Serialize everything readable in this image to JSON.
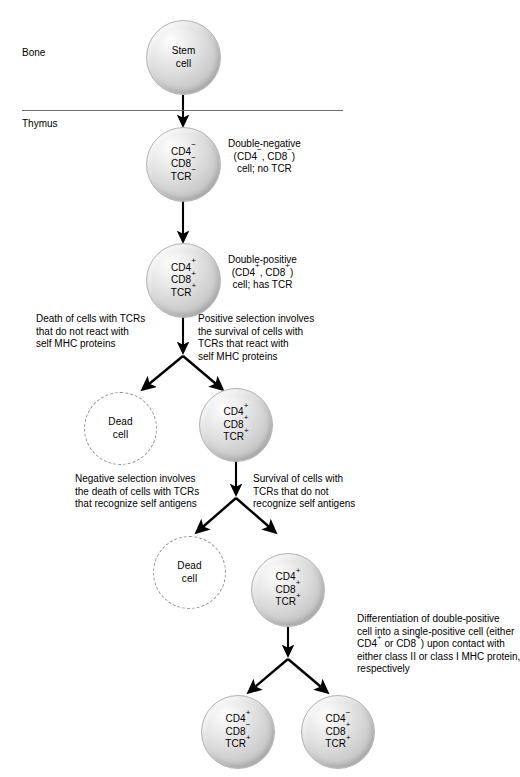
{
  "diagram": {
    "regions": [
      {
        "id": "bone-marrow",
        "label": "Bone\nmarrow"
      },
      {
        "id": "thymus",
        "label": "Thymus"
      }
    ],
    "divider": {
      "name": "bone-marrow-thymus-divider",
      "color": "#6f6f6f"
    },
    "cells": [
      {
        "id": "stem-cell",
        "lines": [
          "Stem",
          "cell"
        ],
        "type": "live"
      },
      {
        "id": "double-negative-cell",
        "lines": [
          "CD4−",
          "CD8−",
          "TCR−"
        ],
        "type": "live"
      },
      {
        "id": "double-positive-cell",
        "lines": [
          "CD4+",
          "CD8+",
          "TCR+"
        ],
        "type": "live"
      },
      {
        "id": "dead-cell-positive-selection",
        "lines": [
          "Dead",
          "cell"
        ],
        "type": "dead"
      },
      {
        "id": "positively-selected-cell",
        "lines": [
          "CD4+",
          "CD8+",
          "TCR+"
        ],
        "type": "live"
      },
      {
        "id": "dead-cell-negative-selection",
        "lines": [
          "Dead",
          "cell"
        ],
        "type": "dead"
      },
      {
        "id": "negatively-selected-survivor",
        "lines": [
          "CD4+",
          "CD8+",
          "TCR+"
        ],
        "type": "live"
      },
      {
        "id": "single-positive-cd4-cell",
        "lines": [
          "CD4+",
          "CD8−",
          "TCR+"
        ],
        "type": "live"
      },
      {
        "id": "single-positive-cd8-cell",
        "lines": [
          "CD4−",
          "CD8+",
          "TCR+"
        ],
        "type": "live"
      }
    ],
    "annotations": [
      {
        "id": "double-negative-note",
        "text": "Double-negative\n(CD4−, CD8−)\ncell; no TCR",
        "align": "center"
      },
      {
        "id": "double-positive-note",
        "text": "Double-positive\n(CD4+, CD8+)\ncell; has TCR",
        "align": "center"
      },
      {
        "id": "positive-selection-death-note",
        "text": "Death of cells with TCRs\nthat do not react with\nself MHC proteins",
        "align": "left"
      },
      {
        "id": "positive-selection-survival-note",
        "text": "Positive selection involves\nthe survival of cells with\nTCRs that react with\nself MHC proteins",
        "align": "left"
      },
      {
        "id": "negative-selection-death-note",
        "text": "Negative selection involves\nthe death of cells with TCRs\nthat recognize self antigens",
        "align": "left"
      },
      {
        "id": "negative-selection-survival-note",
        "text": "Survival of cells with\nTCRs that do not\nrecognize self antigens",
        "align": "left"
      },
      {
        "id": "differentiation-note",
        "text": "Differentiation of double-positive\ncell into a single-positive cell (either\nCD4+ or CD8+) upon contact with\neither class II or class I MHC protein,\nrespectively",
        "align": "left"
      }
    ],
    "colors": {
      "arrow": "#000000",
      "cell_outline": "#b4b4b4",
      "dead_cell_outline": "#8d8d8d",
      "text": "#000000"
    }
  }
}
